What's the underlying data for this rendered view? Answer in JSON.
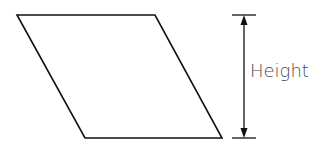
{
  "diagram": {
    "shape": "parallelogram",
    "vertices": [
      [
        17,
        15
      ],
      [
        155,
        15
      ],
      [
        222,
        138
      ],
      [
        85,
        138
      ]
    ],
    "stroke": "#111111",
    "dimension": {
      "label": "Height",
      "x": 244,
      "y_top": 15,
      "y_bottom": 138,
      "tick_x1": 232,
      "tick_x2": 256
    }
  }
}
